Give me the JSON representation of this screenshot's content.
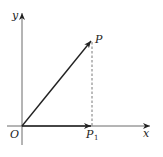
{
  "diagram": {
    "type": "vector-projection",
    "labels": {
      "y_axis": "y",
      "x_axis": "x",
      "origin": "O",
      "point": "P",
      "projection_main": "P",
      "projection_sub": "1"
    },
    "colors": {
      "stroke": "#222222",
      "dashed": "#555555",
      "background": "#ffffff"
    }
  }
}
